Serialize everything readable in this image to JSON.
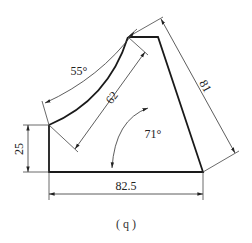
{
  "figure": {
    "caption": "( q )",
    "colors": {
      "outline": "#1a1a1a",
      "dimension": "#333333",
      "background": "#ffffff"
    },
    "dimensions": {
      "left_height": "25",
      "bottom_width": "82.5",
      "right_slant_length": "81",
      "arc_chord": "62",
      "arc_angle": "55°",
      "bottom_right_angle": "71°"
    }
  }
}
